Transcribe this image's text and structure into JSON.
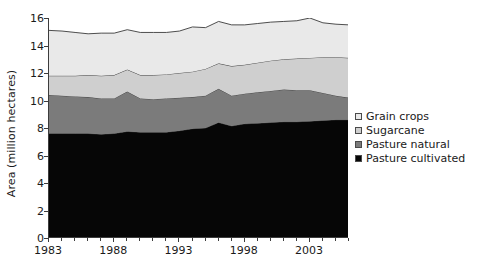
{
  "chart_data": {
    "type": "area",
    "stacked": true,
    "title": "",
    "xlabel": "",
    "ylabel": "Area (million hectares)",
    "ylim": [
      0,
      16
    ],
    "y_ticks": [
      0,
      2,
      4,
      6,
      8,
      10,
      12,
      14,
      16
    ],
    "xlim": [
      1983,
      2006
    ],
    "x_ticks": [
      1983,
      1984,
      1985,
      1986,
      1987,
      1988,
      1989,
      1990,
      1991,
      1992,
      1993,
      1994,
      1995,
      1996,
      1997,
      1998,
      1999,
      2000,
      2001,
      2002,
      2003,
      2004,
      2005,
      2006
    ],
    "x_tick_labels": [
      "1983",
      "1988",
      "1993",
      "1998",
      "2003"
    ],
    "x_tick_label_years": [
      1983,
      1988,
      1993,
      1998,
      2003
    ],
    "grid": false,
    "legend_position": "right",
    "x": [
      1983,
      1984,
      1985,
      1986,
      1987,
      1988,
      1989,
      1990,
      1991,
      1992,
      1993,
      1994,
      1995,
      1996,
      1997,
      1998,
      1999,
      2000,
      2001,
      2002,
      2003,
      2004,
      2005,
      2006
    ],
    "series": [
      {
        "name": "Pasture cultivated",
        "color": "#060606",
        "values": [
          7.6,
          7.6,
          7.6,
          7.6,
          7.55,
          7.6,
          7.75,
          7.7,
          7.7,
          7.7,
          7.8,
          7.95,
          8.0,
          8.4,
          8.15,
          8.3,
          8.35,
          8.4,
          8.45,
          8.45,
          8.5,
          8.55,
          8.6,
          8.6
        ]
      },
      {
        "name": "Pasture natural",
        "color": "#7b7b7b",
        "values": [
          2.8,
          2.75,
          2.7,
          2.65,
          2.6,
          2.55,
          2.9,
          2.45,
          2.4,
          2.45,
          2.4,
          2.3,
          2.35,
          2.45,
          2.2,
          2.2,
          2.25,
          2.3,
          2.35,
          2.3,
          2.25,
          2.0,
          1.75,
          1.6
        ]
      },
      {
        "name": "Sugarcane",
        "color": "#cfcfcf",
        "values": [
          1.4,
          1.45,
          1.5,
          1.6,
          1.65,
          1.7,
          1.6,
          1.7,
          1.75,
          1.75,
          1.8,
          1.85,
          1.95,
          1.85,
          2.15,
          2.1,
          2.15,
          2.2,
          2.2,
          2.3,
          2.35,
          2.6,
          2.8,
          2.9
        ]
      },
      {
        "name": "Grain crops",
        "color": "#e9e9e9",
        "values": [
          3.3,
          3.25,
          3.15,
          3.0,
          3.1,
          3.05,
          2.9,
          3.1,
          3.1,
          3.05,
          3.05,
          3.25,
          3.0,
          3.05,
          3.0,
          2.9,
          2.85,
          2.8,
          2.75,
          2.75,
          2.9,
          2.5,
          2.4,
          2.4
        ]
      }
    ],
    "totals": [
      15.1,
      15.05,
      14.95,
      14.85,
      14.9,
      14.9,
      15.15,
      14.95,
      14.95,
      14.95,
      15.05,
      15.35,
      15.3,
      15.75,
      15.5,
      15.5,
      15.6,
      15.7,
      15.75,
      15.8,
      16.0,
      15.65,
      15.55,
      15.5
    ]
  },
  "legend": {
    "items": [
      {
        "label": "Grain crops",
        "color": "#e9e9e9"
      },
      {
        "label": "Sugarcane",
        "color": "#cfcfcf"
      },
      {
        "label": "Pasture natural",
        "color": "#7b7b7b"
      },
      {
        "label": "Pasture cultivated",
        "color": "#060606"
      }
    ]
  }
}
